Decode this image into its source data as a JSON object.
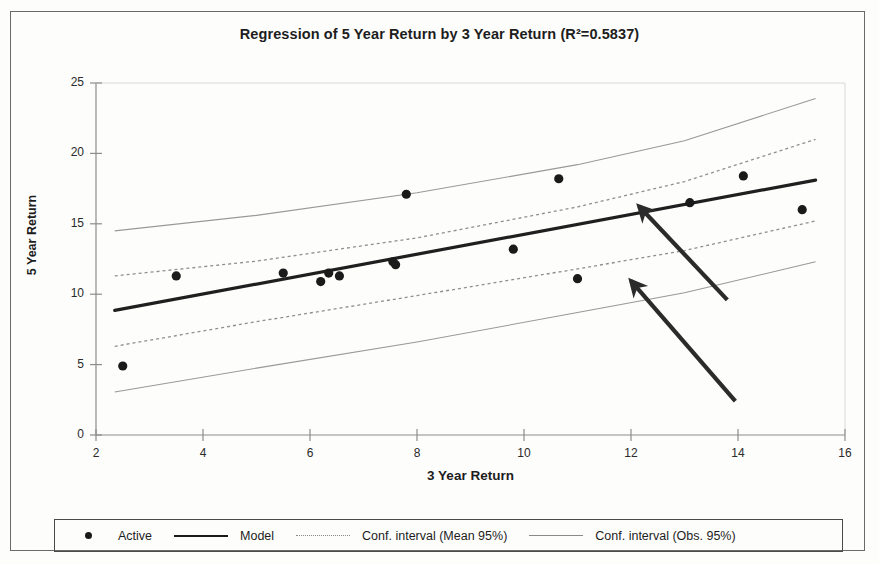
{
  "chart_data": {
    "type": "scatter",
    "title": "Regression of 5 Year Return by 3 Year Return (R²=0.5837)",
    "xlabel": "3 Year Return",
    "ylabel": "5 Year Return",
    "xlim": [
      2,
      16
    ],
    "ylim": [
      0,
      25
    ],
    "xticks": [
      "2",
      "4",
      "6",
      "8",
      "10",
      "12",
      "14",
      "16"
    ],
    "yticks": [
      "0",
      "5",
      "10",
      "15",
      "20",
      "25"
    ],
    "grid": false,
    "r_squared": "0.5837",
    "legend_position": "bottom",
    "series": [
      {
        "name": "Active",
        "type": "scatter",
        "points": [
          {
            "x": 2.5,
            "y": 4.9
          },
          {
            "x": 3.5,
            "y": 11.3
          },
          {
            "x": 5.5,
            "y": 11.5
          },
          {
            "x": 6.2,
            "y": 10.9
          },
          {
            "x": 6.35,
            "y": 11.5
          },
          {
            "x": 6.55,
            "y": 11.3
          },
          {
            "x": 7.55,
            "y": 12.3
          },
          {
            "x": 7.6,
            "y": 12.1
          },
          {
            "x": 7.8,
            "y": 17.1
          },
          {
            "x": 9.8,
            "y": 13.2
          },
          {
            "x": 10.65,
            "y": 18.2
          },
          {
            "x": 11.0,
            "y": 11.1
          },
          {
            "x": 13.1,
            "y": 16.5
          },
          {
            "x": 14.1,
            "y": 18.4
          },
          {
            "x": 15.2,
            "y": 16.0
          }
        ]
      },
      {
        "name": "Model",
        "type": "line",
        "style": "solid-thick",
        "points": [
          {
            "x": 2.35,
            "y": 8.85
          },
          {
            "x": 15.45,
            "y": 18.1
          }
        ]
      },
      {
        "name": "Conf. interval (Mean 95%)",
        "type": "band",
        "style": "dotted",
        "upper": [
          {
            "x": 2.35,
            "y": 11.3
          },
          {
            "x": 5.0,
            "y": 12.35
          },
          {
            "x": 8.0,
            "y": 14.0
          },
          {
            "x": 11.0,
            "y": 16.2
          },
          {
            "x": 13.0,
            "y": 18.0
          },
          {
            "x": 15.45,
            "y": 21.0
          }
        ],
        "lower": [
          {
            "x": 2.35,
            "y": 6.3
          },
          {
            "x": 5.0,
            "y": 8.05
          },
          {
            "x": 8.0,
            "y": 9.9
          },
          {
            "x": 11.0,
            "y": 11.8
          },
          {
            "x": 13.0,
            "y": 13.1
          },
          {
            "x": 15.45,
            "y": 15.2
          }
        ]
      },
      {
        "name": "Conf. interval (Obs. 95%)",
        "type": "band",
        "style": "solid-thin",
        "upper": [
          {
            "x": 2.35,
            "y": 14.5
          },
          {
            "x": 5.0,
            "y": 15.6
          },
          {
            "x": 8.0,
            "y": 17.2
          },
          {
            "x": 11.0,
            "y": 19.2
          },
          {
            "x": 13.0,
            "y": 20.9
          },
          {
            "x": 15.45,
            "y": 23.9
          }
        ],
        "lower": [
          {
            "x": 2.35,
            "y": 3.05
          },
          {
            "x": 5.0,
            "y": 4.75
          },
          {
            "x": 8.0,
            "y": 6.6
          },
          {
            "x": 11.0,
            "y": 8.7
          },
          {
            "x": 13.0,
            "y": 10.1
          },
          {
            "x": 15.45,
            "y": 12.3
          }
        ]
      }
    ],
    "annotations": [
      {
        "name": "arrow-to-mean-upper-band",
        "tail": {
          "x": 13.8,
          "y": 9.6
        },
        "tip": {
          "x": 12.15,
          "y": 16.25
        }
      },
      {
        "name": "arrow-to-obs-lower-band",
        "tail": {
          "x": 13.95,
          "y": 2.4
        },
        "tip": {
          "x": 12.0,
          "y": 10.95
        }
      }
    ]
  },
  "legend": {
    "items": [
      {
        "label": "Active",
        "key": "dot-marker"
      },
      {
        "label": "Model",
        "key": "solid-thick-line"
      },
      {
        "label": "Conf. interval (Mean 95%)",
        "key": "dotted-line"
      },
      {
        "label": "Conf. interval (Obs. 95%)",
        "key": "solid-thin-line"
      }
    ]
  }
}
